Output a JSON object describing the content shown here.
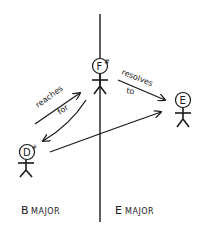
{
  "diagram": {
    "type": "hand-drawn key relationship diagram",
    "colors": {
      "ink": "#1a1a1a",
      "background": "#ffffff"
    },
    "nodes": [
      {
        "id": "f-sharp",
        "note": "F",
        "accidental": "#"
      },
      {
        "id": "e",
        "note": "E",
        "accidental": ""
      },
      {
        "id": "d-sharp",
        "note": "D",
        "accidental": "#"
      }
    ],
    "edges": [
      {
        "from": "d-sharp",
        "to": "f-sharp",
        "label_line1": "reaches",
        "label_line2": "for"
      },
      {
        "from": "f-sharp",
        "to": "d-sharp",
        "label_line1": "",
        "label_line2": ""
      },
      {
        "from": "f-sharp",
        "to": "e",
        "label_line1": "resolves",
        "label_line2": "to"
      },
      {
        "from": "d-sharp",
        "to": "e",
        "label_line1": "",
        "label_line2": ""
      }
    ],
    "regions": [
      {
        "id": "b-major",
        "label_first": "B",
        "label_rest": "MAJOR"
      },
      {
        "id": "e-major",
        "label_first": "E",
        "label_rest": "MAJOR"
      }
    ]
  }
}
